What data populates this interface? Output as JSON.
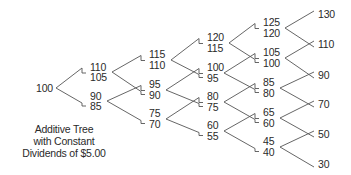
{
  "title": "Additive Tree with Constant Dividends of $5.00",
  "caption_lines": [
    "Additive Tree",
    "with Constant",
    "Dividends of $5.00"
  ],
  "line_color": "#555555",
  "text_color": "#2a2a2a",
  "root": {
    "value": "100",
    "x": 36,
    "y": 88
  },
  "levels": [
    {
      "x": 90,
      "nodes": [
        {
          "pre": "110",
          "post": "105",
          "yPre": 67,
          "yPost": 77
        },
        {
          "pre": "90",
          "post": "85",
          "yPre": 96,
          "yPost": 106
        }
      ]
    },
    {
      "x": 149,
      "nodes": [
        {
          "pre": "115",
          "post": "110",
          "yPre": 54,
          "yPost": 65
        },
        {
          "pre": "95",
          "post": "90",
          "yPre": 84,
          "yPost": 95
        },
        {
          "pre": "75",
          "post": "70",
          "yPre": 113,
          "yPost": 124
        }
      ]
    },
    {
      "x": 207,
      "nodes": [
        {
          "pre": "120",
          "post": "115",
          "yPre": 37,
          "yPost": 48
        },
        {
          "pre": "100",
          "post": "95",
          "yPre": 67,
          "yPost": 78
        },
        {
          "pre": "80",
          "post": "75",
          "yPre": 96,
          "yPost": 107
        },
        {
          "pre": "60",
          "post": "55",
          "yPre": 125,
          "yPost": 136
        }
      ]
    },
    {
      "x": 263,
      "nodes": [
        {
          "pre": "125",
          "post": "120",
          "yPre": 22,
          "yPost": 33
        },
        {
          "pre": "105",
          "post": "100",
          "yPre": 52,
          "yPost": 63
        },
        {
          "pre": "85",
          "post": "80",
          "yPre": 82,
          "yPost": 93
        },
        {
          "pre": "65",
          "post": "60",
          "yPre": 112,
          "yPost": 123
        },
        {
          "pre": "45",
          "post": "40",
          "yPre": 141,
          "yPost": 152
        }
      ]
    }
  ],
  "terminal": {
    "x": 318,
    "nodes": [
      {
        "value": "130",
        "y": 14
      },
      {
        "value": "110",
        "y": 44
      },
      {
        "value": "90",
        "y": 75
      },
      {
        "value": "70",
        "y": 104
      },
      {
        "value": "50",
        "y": 134
      },
      {
        "value": "30",
        "y": 164
      }
    ]
  }
}
